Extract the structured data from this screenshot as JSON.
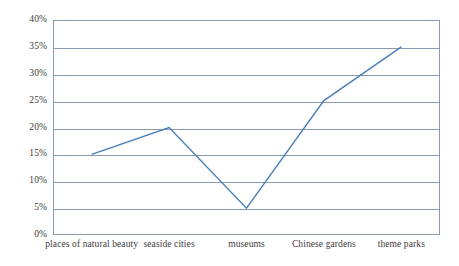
{
  "chart_data": {
    "type": "line",
    "title": "",
    "xlabel": "",
    "ylabel": "",
    "categories": [
      "places of natural beauty",
      "seaside cities",
      "museums",
      "Chinese gardens",
      "theme parks"
    ],
    "values": [
      15,
      20,
      5,
      25,
      35
    ],
    "value_unit": "%",
    "ylim": [
      0,
      40
    ],
    "ytick_step": 5,
    "ytick_labels": [
      "0%",
      "5%",
      "10%",
      "15%",
      "20%",
      "25%",
      "30%",
      "35%",
      "40%"
    ],
    "ytick_values": [
      0,
      5,
      10,
      15,
      20,
      25,
      30,
      35,
      40
    ],
    "grid": "horizontal",
    "legend": "none",
    "series": [
      {
        "name": "",
        "values": [
          15,
          20,
          5,
          25,
          35
        ]
      }
    ],
    "colors": {
      "line": "#4a7ebb",
      "grid": "#8a9ab0",
      "axis": "#8a9ab0",
      "text": "#3c3c3c",
      "background": "#ffffff"
    }
  }
}
